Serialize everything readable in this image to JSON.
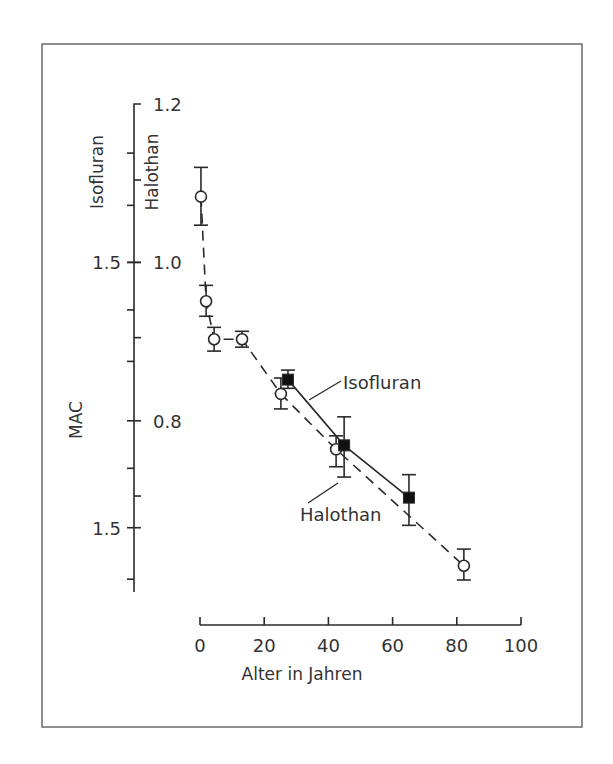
{
  "chart_data": {
    "type": "scatter",
    "title": "",
    "xlabel": "Alter in Jahren",
    "ylabel": "MAC",
    "secondary_axis_titles": [
      "Isofluran",
      "Halothan"
    ],
    "xlim": [
      0,
      100
    ],
    "ylim_halothan": [
      0.56,
      1.2
    ],
    "x_ticks": [
      0,
      20,
      40,
      60,
      80,
      100
    ],
    "y_ticks_halothan": [
      {
        "value": 1.2,
        "label": "1.2"
      },
      {
        "value": 1.0,
        "label": "1.0"
      },
      {
        "value": 0.8,
        "label": "0.8"
      }
    ],
    "y_ticks_isofluran": [
      {
        "value": 1.0,
        "label": "1.5"
      },
      {
        "value": 0.665,
        "label": "1.5"
      }
    ],
    "y_minor_ticks": [
      1.138,
      1.104,
      1.072,
      0.94,
      0.905,
      0.875,
      0.74,
      0.705,
      0.6
    ],
    "grid": false,
    "legend": "inline-labels",
    "series": [
      {
        "name": "Halothan",
        "marker": "open-circle",
        "line": "dashed",
        "points": [
          {
            "x": 0.3,
            "y": 1.083,
            "err_low": 1.047,
            "err_high": 1.12
          },
          {
            "x": 1.9,
            "y": 0.951,
            "err_low": 0.932,
            "err_high": 0.971
          },
          {
            "x": 4.4,
            "y": 0.903,
            "err_low": 0.888,
            "err_high": 0.918
          },
          {
            "x": 13.1,
            "y": 0.903,
            "err_low": 0.893,
            "err_high": 0.913
          },
          {
            "x": 25.2,
            "y": 0.834,
            "err_low": 0.815,
            "err_high": 0.854
          },
          {
            "x": 42.4,
            "y": 0.764,
            "err_low": 0.742,
            "err_high": 0.781
          },
          {
            "x": 82.2,
            "y": 0.617,
            "err_low": 0.599,
            "err_high": 0.638
          }
        ]
      },
      {
        "name": "Isofluran",
        "marker": "filled-square",
        "line": "solid",
        "points": [
          {
            "x": 27.4,
            "y": 0.852,
            "err_low": 0.841,
            "err_high": 0.864
          },
          {
            "x": 44.9,
            "y": 0.769,
            "err_low": 0.729,
            "err_high": 0.805
          },
          {
            "x": 65.1,
            "y": 0.703,
            "err_low": 0.668,
            "err_high": 0.732
          }
        ]
      }
    ]
  }
}
